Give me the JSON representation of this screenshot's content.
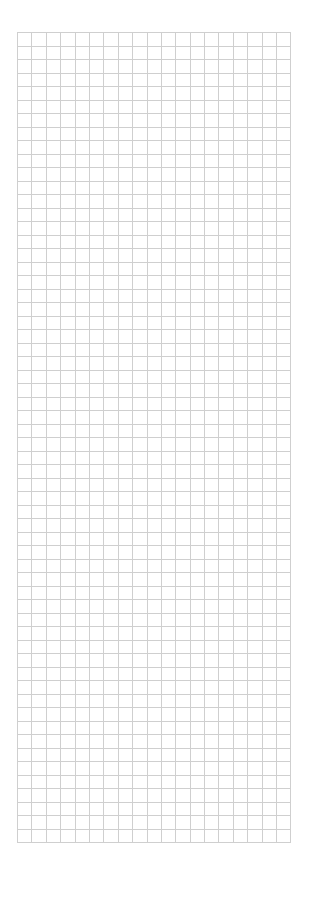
{
  "sheet": {
    "columns": 19,
    "rows": 60,
    "cells": [],
    "grid_color": "#cfcfcf",
    "background": "#ffffff"
  }
}
